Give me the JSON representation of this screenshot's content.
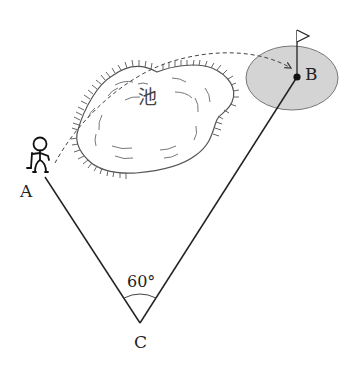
{
  "diagram": {
    "type": "geometry-word-problem",
    "points": [
      {
        "id": "A",
        "label": "A",
        "x": 45,
        "y": 177
      },
      {
        "id": "B",
        "label": "B",
        "x": 297,
        "y": 77
      },
      {
        "id": "C",
        "label": "C",
        "x": 140,
        "y": 323
      }
    ],
    "segments": [
      {
        "from": "A",
        "to": "C"
      },
      {
        "from": "C",
        "to": "B"
      }
    ],
    "angle": {
      "vertex": "C",
      "label": "60°"
    },
    "pond": {
      "label": "池"
    },
    "green": {
      "fill": "#d4d4d4"
    },
    "golfer": {
      "near": "A"
    },
    "flag": {
      "at": "B"
    },
    "trajectory": {
      "style": "dashed",
      "from": "golfer",
      "to": "B",
      "arrow": true
    }
  },
  "colors": {
    "line": "#222222",
    "pond_outline": "#555555",
    "green_fill": "#d4d4d4",
    "green_outline": "#777777"
  }
}
